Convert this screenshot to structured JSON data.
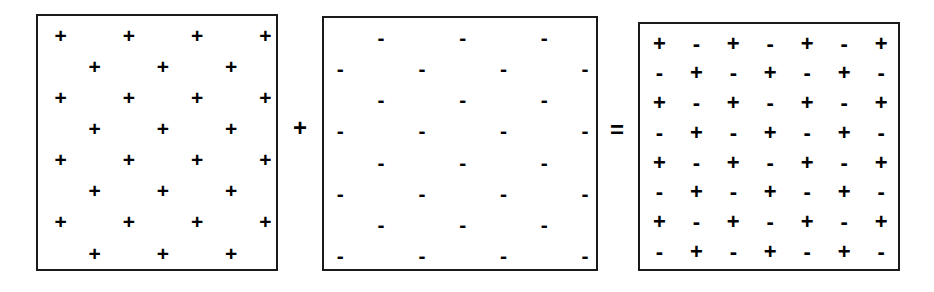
{
  "figure": {
    "kind": "equation-of-sign-lattices",
    "background_color": "#ffffff",
    "ink_color": "#000000",
    "border_color": "#1a1a1a",
    "glyphs": {
      "plus": "+",
      "minus": "-"
    },
    "operators": {
      "add": "+",
      "equals": "="
    },
    "panels": [
      {
        "id": "source-a",
        "name": "plus-lattice",
        "columns": 7,
        "rows": 8,
        "pattern": "staggered-plus",
        "rows_data": [
          [
            "+",
            "",
            "+",
            "",
            "+",
            "",
            "+"
          ],
          [
            "",
            "+",
            "",
            "+",
            "",
            "+",
            ""
          ],
          [
            "+",
            "",
            "+",
            "",
            "+",
            "",
            "+"
          ],
          [
            "",
            "+",
            "",
            "+",
            "",
            "+",
            ""
          ],
          [
            "+",
            "",
            "+",
            "",
            "+",
            "",
            "+"
          ],
          [
            "",
            "+",
            "",
            "+",
            "",
            "+",
            ""
          ],
          [
            "+",
            "",
            "+",
            "",
            "+",
            "",
            "+"
          ],
          [
            "",
            "+",
            "",
            "+",
            "",
            "+",
            ""
          ]
        ]
      },
      {
        "id": "source-b",
        "name": "minus-lattice",
        "columns": 7,
        "rows": 8,
        "pattern": "staggered-minus",
        "rows_data": [
          [
            "",
            "-",
            "",
            "-",
            "",
            "-",
            ""
          ],
          [
            "-",
            "",
            "-",
            "",
            "-",
            "",
            "-"
          ],
          [
            "",
            "-",
            "",
            "-",
            "",
            "-",
            ""
          ],
          [
            "-",
            "",
            "-",
            "",
            "-",
            "",
            "-"
          ],
          [
            "",
            "-",
            "",
            "-",
            "",
            "-",
            ""
          ],
          [
            "-",
            "",
            "-",
            "",
            "-",
            "",
            "-"
          ],
          [
            "",
            "-",
            "",
            "-",
            "",
            "-",
            ""
          ],
          [
            "-",
            "",
            "-",
            "",
            "-",
            "",
            "-"
          ]
        ]
      },
      {
        "id": "result",
        "name": "checkerboard-result",
        "columns": 7,
        "rows": 8,
        "pattern": "alternating-checkerboard",
        "rows_data": [
          [
            "+",
            "-",
            "+",
            "-",
            "+",
            "-",
            "+"
          ],
          [
            "-",
            "+",
            "-",
            "+",
            "-",
            "+",
            "-"
          ],
          [
            "+",
            "-",
            "+",
            "-",
            "+",
            "-",
            "+"
          ],
          [
            "-",
            "+",
            "-",
            "+",
            "-",
            "+",
            "-"
          ],
          [
            "+",
            "-",
            "+",
            "-",
            "+",
            "-",
            "+"
          ],
          [
            "-",
            "+",
            "-",
            "+",
            "-",
            "+",
            "-"
          ],
          [
            "+",
            "-",
            "+",
            "-",
            "+",
            "-",
            "+"
          ],
          [
            "-",
            "+",
            "-",
            "+",
            "-",
            "+",
            "-"
          ]
        ]
      }
    ]
  }
}
